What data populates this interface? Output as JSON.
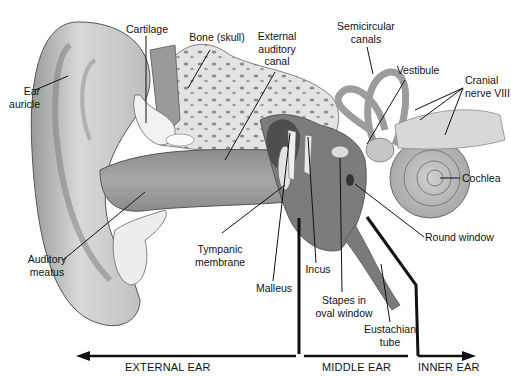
{
  "diagram": {
    "labels": {
      "ear_auricle": [
        "Ear",
        "auricle"
      ],
      "cartilage": "Cartilage",
      "bone_skull": "Bone (skull)",
      "external_auditory_canal": [
        "External",
        "auditory",
        "canal"
      ],
      "semicircular_canals": [
        "Semicircular",
        "canals"
      ],
      "vestibule": "Vestibule",
      "cranial_nerve": [
        "Cranial",
        "nerve VIII"
      ],
      "cochlea": "Cochlea",
      "round_window": "Round window",
      "auditory_meatus": [
        "Auditory",
        "meatus"
      ],
      "tympanic_membrane": [
        "Tympanic",
        "membrane"
      ],
      "malleus": "Malleus",
      "incus": "Incus",
      "stapes": [
        "Stapes in",
        "oval window"
      ],
      "eustachian_tube": [
        "Eustachian",
        "tube"
      ]
    },
    "regions": {
      "external": "EXTERNAL EAR",
      "middle": "MIDDLE EAR",
      "inner": "INNER EAR"
    },
    "colors": {
      "skin_light": "#d9d9d9",
      "skin_mid": "#b5b5b5",
      "skin_dark": "#8a8a8a",
      "bone": "#e6e6e6",
      "line": "#111111"
    }
  }
}
